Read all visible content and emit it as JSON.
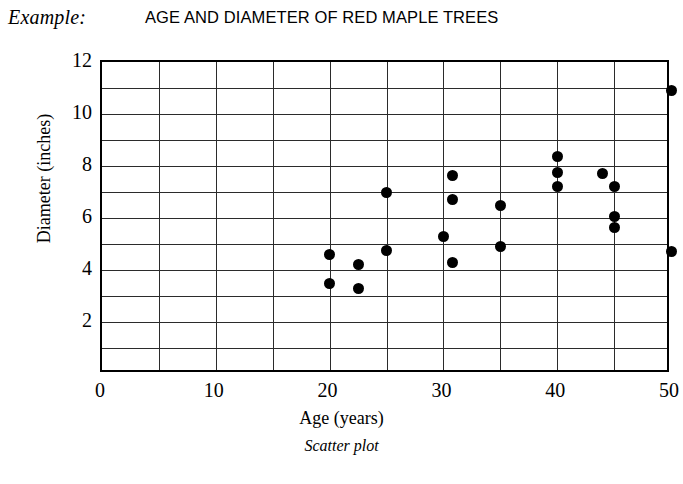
{
  "header": {
    "example_label": "Example:",
    "title": "AGE AND DIAMETER OF RED MAPLE TREES"
  },
  "caption": "Scatter plot",
  "chart_data": {
    "type": "scatter",
    "title": "AGE AND DIAMETER OF RED MAPLE TREES",
    "xlabel": "Age (years)",
    "ylabel": "Diameter (inches)",
    "xlim": [
      0,
      50
    ],
    "ylim": [
      0,
      12
    ],
    "xticks": [
      0,
      10,
      20,
      30,
      40,
      50
    ],
    "yticks": [
      2,
      4,
      6,
      8,
      10,
      12
    ],
    "xtick_labels": [
      "0",
      "10",
      "20",
      "30",
      "40",
      "50"
    ],
    "ytick_labels": [
      "2",
      "4",
      "6",
      "8",
      "10",
      "12"
    ],
    "grid": true,
    "grid_x_step": 5,
    "grid_y_step": 1,
    "legend": "none",
    "marker": "filled-circle",
    "marker_color": "#000000",
    "points": [
      {
        "x": 20.0,
        "y": 4.6
      },
      {
        "x": 20.0,
        "y": 3.5
      },
      {
        "x": 22.5,
        "y": 4.2
      },
      {
        "x": 22.5,
        "y": 3.3
      },
      {
        "x": 25.0,
        "y": 7.0
      },
      {
        "x": 25.0,
        "y": 4.75
      },
      {
        "x": 30.0,
        "y": 5.3
      },
      {
        "x": 30.8,
        "y": 7.65
      },
      {
        "x": 30.8,
        "y": 6.7
      },
      {
        "x": 30.8,
        "y": 4.3
      },
      {
        "x": 35.0,
        "y": 6.5
      },
      {
        "x": 35.0,
        "y": 4.9
      },
      {
        "x": 40.0,
        "y": 8.35
      },
      {
        "x": 40.0,
        "y": 7.75
      },
      {
        "x": 40.0,
        "y": 7.2
      },
      {
        "x": 44.0,
        "y": 7.7
      },
      {
        "x": 45.0,
        "y": 7.2
      },
      {
        "x": 45.0,
        "y": 6.05
      },
      {
        "x": 45.0,
        "y": 5.65
      },
      {
        "x": 50.0,
        "y": 10.9
      },
      {
        "x": 50.0,
        "y": 4.7
      }
    ]
  }
}
